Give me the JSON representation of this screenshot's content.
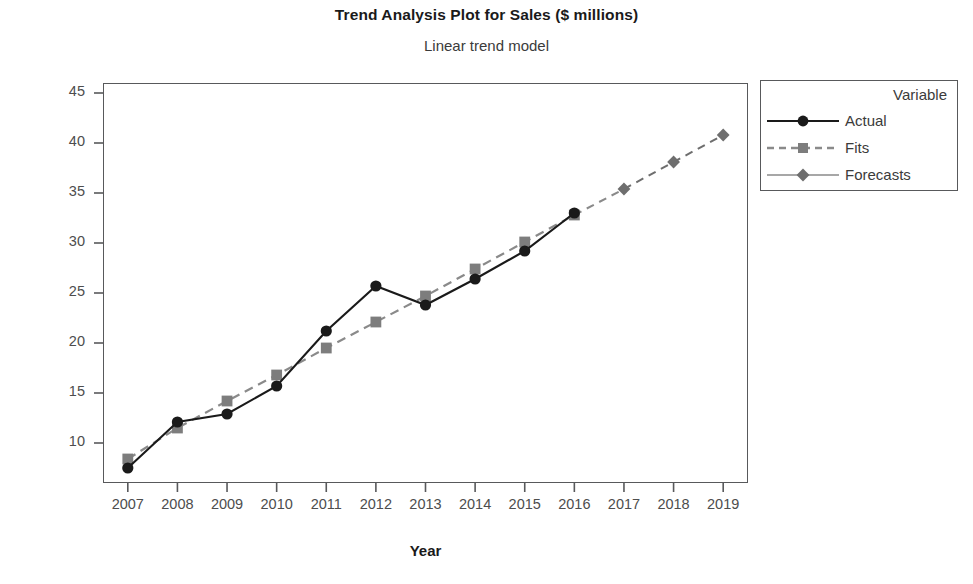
{
  "chart_data": {
    "type": "line",
    "title": "Trend Analysis Plot for Sales ($ millions)",
    "subtitle": "Linear trend model",
    "xlabel": "Year",
    "ylabel": "Sales ($ millions)",
    "x": [
      2007,
      2008,
      2009,
      2010,
      2011,
      2012,
      2013,
      2014,
      2015,
      2016,
      2017,
      2018,
      2019
    ],
    "xticklabels": [
      "2007",
      "2008",
      "2009",
      "2010",
      "2011",
      "2012",
      "2013",
      "2014",
      "2015",
      "2016",
      "2017",
      "2018",
      "2019"
    ],
    "yticklabels": [
      "10",
      "15",
      "20",
      "25",
      "30",
      "35",
      "40",
      "45"
    ],
    "yticks": [
      10,
      15,
      20,
      25,
      30,
      35,
      40,
      45
    ],
    "ylim": [
      6,
      46
    ],
    "xlim": [
      2006.5,
      2019.5
    ],
    "grid": false,
    "legend_position": "right-outside",
    "series": [
      {
        "name": "Actual",
        "marker": "circle",
        "linestyle": "solid",
        "color": "#1a1a1a",
        "x": [
          2007,
          2008,
          2009,
          2010,
          2011,
          2012,
          2013,
          2014,
          2015,
          2016
        ],
        "values": [
          7.5,
          12.1,
          12.9,
          15.7,
          21.2,
          25.7,
          23.8,
          26.4,
          29.2,
          33.0
        ]
      },
      {
        "name": "Fits",
        "marker": "square",
        "linestyle": "dashed",
        "color": "#8a8a8a",
        "x": [
          2007,
          2008,
          2009,
          2010,
          2011,
          2012,
          2013,
          2014,
          2015,
          2016
        ],
        "values": [
          8.4,
          11.5,
          14.2,
          16.8,
          19.5,
          22.1,
          24.7,
          27.4,
          30.1,
          32.8
        ]
      },
      {
        "name": "Forecasts",
        "marker": "diamond",
        "linestyle": "dashed",
        "color": "#6e6e6e",
        "x": [
          2017,
          2018,
          2019
        ],
        "values": [
          35.4,
          38.1,
          40.8
        ]
      }
    ]
  },
  "legend": {
    "title": "Variable",
    "entries": [
      {
        "label": "Actual"
      },
      {
        "label": "Fits"
      },
      {
        "label": "Forecasts"
      }
    ]
  }
}
